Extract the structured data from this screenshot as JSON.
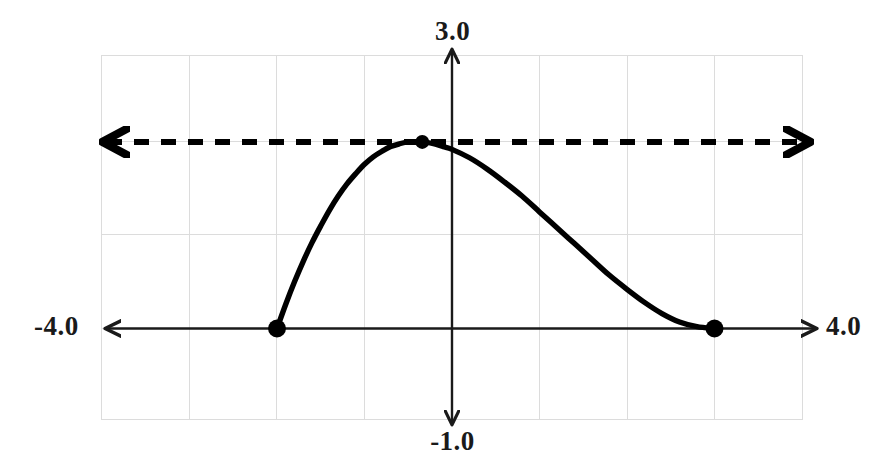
{
  "chart_data": {
    "type": "line",
    "title": "",
    "xlabel": "",
    "ylabel": "",
    "xlim": [
      -4.0,
      4.0
    ],
    "ylim": [
      -1.0,
      3.0
    ],
    "grid": true,
    "grid_step_x": 1.0,
    "grid_step_y": 1.0,
    "legend": "none",
    "axis_labels": {
      "top": "3.0",
      "bottom": "-1.0",
      "left": "-4.0",
      "right": "4.0"
    },
    "series": [
      {
        "name": "cubic-curve",
        "style": "solid",
        "color": "#000000",
        "width": 5,
        "x": [
          -2.0,
          -1.9,
          -1.8,
          -1.7,
          -1.6,
          -1.5,
          -1.4,
          -1.3,
          -1.2,
          -1.1,
          -1.0,
          -0.9,
          -0.8,
          -0.7,
          -0.6,
          -0.5,
          -0.4,
          -0.34,
          -0.2,
          -0.1,
          0.0,
          0.2,
          0.4,
          0.6,
          0.8,
          1.0,
          1.2,
          1.4,
          1.6,
          1.8,
          2.0,
          2.2,
          2.4,
          2.6,
          2.8,
          3.0
        ],
        "y": [
          0.0,
          0.26,
          0.5,
          0.72,
          0.92,
          1.1,
          1.27,
          1.42,
          1.55,
          1.66,
          1.76,
          1.84,
          1.9,
          1.95,
          1.98,
          2.0,
          2.0,
          2.0,
          1.98,
          1.95,
          1.92,
          1.83,
          1.71,
          1.57,
          1.42,
          1.25,
          1.08,
          0.91,
          0.74,
          0.57,
          0.42,
          0.28,
          0.16,
          0.07,
          0.02,
          0.0
        ]
      },
      {
        "name": "asymptote-line",
        "style": "dashed",
        "color": "#000000",
        "width": 6,
        "y_value": 2.0,
        "arrows": "both",
        "x_start": -4.0,
        "x_end": 4.0
      }
    ],
    "points": [
      {
        "name": "left-root",
        "x": -2.0,
        "y": 0.0,
        "marker": "filled-circle",
        "radius": 9
      },
      {
        "name": "vertex",
        "x": -0.34,
        "y": 2.0,
        "marker": "filled-circle",
        "radius": 7
      },
      {
        "name": "right-root",
        "x": 3.0,
        "y": 0.0,
        "marker": "filled-circle",
        "radius": 9
      }
    ],
    "axes": {
      "x_axis": {
        "y_value": 0.0,
        "arrows": "both",
        "from": -4.0,
        "to": 4.0,
        "color": "#1a1a1a"
      },
      "y_axis": {
        "x_value": 0.0,
        "arrows": "both",
        "from": -1.0,
        "to": 3.0,
        "color": "#1a1a1a"
      }
    },
    "colors": {
      "curve": "#000000",
      "axis": "#1a1a1a",
      "grid": "#d9d9d9",
      "background": "#ffffff",
      "text": "#1a1a1a"
    }
  }
}
